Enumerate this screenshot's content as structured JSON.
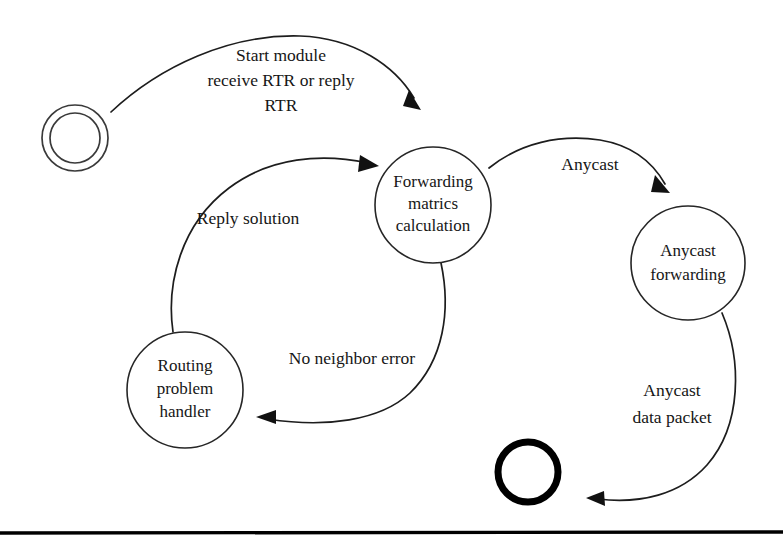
{
  "diagram": {
    "background_color": "#ffffff",
    "line_color": "#1d1d1d",
    "text_color": "#161616",
    "nodes": [
      {
        "id": "start",
        "type": "start-state",
        "label": "",
        "cx": 75,
        "cy": 138,
        "r_outer": 33,
        "r_inner": 25
      },
      {
        "id": "forwarding-matrics-calculation",
        "type": "state",
        "label_lines": [
          "Forwarding",
          "matrics",
          "calculation"
        ],
        "cx": 433,
        "cy": 205,
        "r": 58
      },
      {
        "id": "anycast-forwarding",
        "type": "state",
        "label_lines": [
          "Anycast",
          "forwarding"
        ],
        "cx": 688,
        "cy": 263,
        "r": 57
      },
      {
        "id": "routing-problem-handler",
        "type": "state",
        "label_lines": [
          "Routing",
          "problem",
          "handler"
        ],
        "cx": 185,
        "cy": 390,
        "r": 58
      },
      {
        "id": "end",
        "type": "end-state",
        "label": "",
        "cx": 528,
        "cy": 472,
        "r": 30
      }
    ],
    "edges": [
      {
        "id": "start-to-forwarding",
        "from": "start",
        "to": "forwarding-matrics-calculation",
        "label_lines": [
          "Start module",
          "receive RTR or reply",
          "RTR"
        ]
      },
      {
        "id": "forwarding-to-anycast",
        "from": "forwarding-matrics-calculation",
        "to": "anycast-forwarding",
        "label_lines": [
          "Anycast"
        ]
      },
      {
        "id": "anycast-to-end",
        "from": "anycast-forwarding",
        "to": "end",
        "label_lines": [
          "Anycast",
          "data packet"
        ]
      },
      {
        "id": "forwarding-to-routing",
        "from": "forwarding-matrics-calculation",
        "to": "routing-problem-handler",
        "label_lines": [
          "No neighbor error"
        ]
      },
      {
        "id": "routing-to-forwarding",
        "from": "routing-problem-handler",
        "to": "forwarding-matrics-calculation",
        "label_lines": [
          "Reply solution"
        ]
      }
    ]
  }
}
